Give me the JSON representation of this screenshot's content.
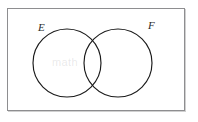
{
  "figure": {
    "kind": "venn-diagram",
    "background_color": "#ffffff",
    "stroke_color": "#1a1a1a",
    "box_border_color": "#8e8e90"
  },
  "universe": {
    "name": "sample-space-rectangle",
    "label": "",
    "x": 7,
    "y": 8,
    "width": 178,
    "height": 103
  },
  "sets": [
    {
      "id": "E",
      "label": "E",
      "name": "set-e",
      "cx": 67,
      "cy": 63,
      "r": 34,
      "label_x": 38,
      "label_y": 22
    },
    {
      "id": "F",
      "label": "F",
      "name": "set-f",
      "cx": 118,
      "cy": 63,
      "r": 34,
      "label_x": 148,
      "label_y": 20
    }
  ],
  "artifacts": {
    "watermark_text": "math"
  }
}
